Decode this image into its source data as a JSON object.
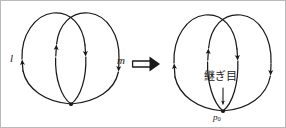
{
  "figure": {
    "kind": "math-topology-diagram",
    "stroke_color": "#1a1a1a",
    "background_color": "#ffffff",
    "frame_color": "#b9b9b9",
    "left_panel": {
      "description": "two-loops-crossing",
      "label_l": "l",
      "label_m": "m"
    },
    "connector": {
      "symbol": "⟹",
      "name": "double-right-arrow"
    },
    "right_panel": {
      "description": "two-loops-joined-at-basepoint",
      "seam_label": "継ぎ目",
      "basepoint_label": "p",
      "basepoint_subscript": "0"
    }
  }
}
